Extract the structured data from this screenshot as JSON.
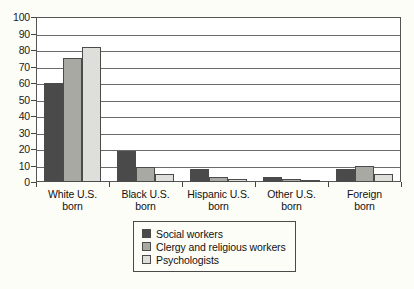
{
  "chart_data": {
    "type": "bar",
    "title": "",
    "xlabel": "",
    "ylabel": "",
    "ylim": [
      0,
      100
    ],
    "yticks": [
      0,
      10,
      20,
      30,
      40,
      50,
      60,
      70,
      80,
      90,
      100
    ],
    "grid": true,
    "legend_position": "bottom-center",
    "categories": [
      "White U.S. born",
      "Black U.S. born",
      "Hispanic U.S. born",
      "Other U.S. born",
      "Foreign born"
    ],
    "category_lines": [
      [
        "White U.S.",
        "born"
      ],
      [
        "Black U.S.",
        "born"
      ],
      [
        "Hispanic U.S.",
        "born"
      ],
      [
        "Other U.S.",
        "born"
      ],
      [
        "Foreign",
        "born"
      ]
    ],
    "series": [
      {
        "name": "Social workers",
        "color": "#4a4a4a",
        "values": [
          60,
          19,
          8,
          3,
          8
        ]
      },
      {
        "name": "Clergy and religious workers",
        "color": "#a9a9a4",
        "values": [
          75,
          9,
          3,
          2,
          10
        ]
      },
      {
        "name": "Psychologists",
        "color": "#dededa",
        "values": [
          82,
          5,
          2,
          1,
          5
        ]
      }
    ]
  },
  "colors": {
    "page_background": "#fdfdf8",
    "plot_background": "#ffffff",
    "axis": "#4a4a4a",
    "gridline": "#6a6a6a",
    "text": "#111111"
  }
}
